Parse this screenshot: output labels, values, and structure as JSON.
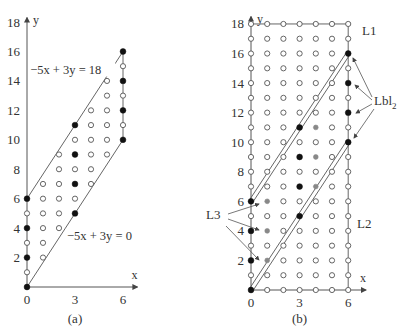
{
  "panels": [
    {
      "id": "a",
      "caption": "(a)",
      "origin_px": [
        27,
        287
      ],
      "unit_px": [
        16,
        14.72
      ],
      "axis_x_end": 6.9,
      "axis_y_end": 18.3,
      "x_axis_label": "x",
      "y_axis_label": "y",
      "x_ticks": [
        0,
        3,
        6
      ],
      "y_ticks": [
        2,
        4,
        6,
        8,
        10,
        12,
        14,
        16,
        18
      ],
      "lines": [
        {
          "name": "upper-constraint",
          "from": [
            0,
            6
          ],
          "to": [
            6,
            16
          ],
          "label": "−5x + 3y = 18",
          "label_pos": [
            0.2,
            14.5
          ]
        },
        {
          "name": "lower-constraint",
          "from": [
            0,
            0
          ],
          "to": [
            6,
            10
          ],
          "label": "−5x + 3y = 0",
          "label_pos": [
            2.5,
            3.2
          ]
        },
        {
          "name": "right-edge",
          "from": [
            6,
            10
          ],
          "to": [
            6,
            16
          ],
          "label": "",
          "label_pos": null
        }
      ],
      "filled_points": [
        [
          0,
          0
        ],
        [
          0,
          2
        ],
        [
          0,
          4
        ],
        [
          0,
          6
        ],
        [
          3,
          5
        ],
        [
          3,
          7
        ],
        [
          3,
          9
        ],
        [
          3,
          11
        ],
        [
          6,
          10
        ],
        [
          6,
          12
        ],
        [
          6,
          14
        ],
        [
          6,
          16
        ]
      ],
      "gray_points": [],
      "open_points": [
        [
          0,
          1
        ],
        [
          0,
          3
        ],
        [
          0,
          5
        ],
        [
          1,
          2
        ],
        [
          1,
          3
        ],
        [
          1,
          4
        ],
        [
          1,
          5
        ],
        [
          1,
          6
        ],
        [
          1,
          7
        ],
        [
          2,
          4
        ],
        [
          2,
          5
        ],
        [
          2,
          6
        ],
        [
          2,
          7
        ],
        [
          2,
          8
        ],
        [
          2,
          9
        ],
        [
          3,
          6
        ],
        [
          3,
          8
        ],
        [
          3,
          10
        ],
        [
          4,
          7
        ],
        [
          4,
          8
        ],
        [
          4,
          9
        ],
        [
          4,
          10
        ],
        [
          4,
          11
        ],
        [
          4,
          12
        ],
        [
          5,
          9
        ],
        [
          5,
          10
        ],
        [
          5,
          11
        ],
        [
          5,
          12
        ],
        [
          5,
          13
        ],
        [
          5,
          14
        ],
        [
          6,
          11
        ],
        [
          6,
          13
        ],
        [
          6,
          15
        ]
      ]
    },
    {
      "id": "b",
      "caption": "(b)",
      "origin_px": [
        251,
        290
      ],
      "unit_px": [
        16.2,
        14.78
      ],
      "axis_x_end": 7.1,
      "axis_y_end": 18.5,
      "x_axis_label": "x",
      "y_axis_label": "y",
      "x_ticks": [
        0,
        3,
        6
      ],
      "y_ticks": [
        2,
        4,
        6,
        8,
        10,
        12,
        14,
        16,
        18
      ],
      "grid_range": {
        "x": [
          0,
          6
        ],
        "y": [
          0,
          18
        ]
      },
      "border_lines": [
        {
          "name": "top-border",
          "from": [
            0,
            18
          ],
          "to": [
            6,
            18
          ]
        },
        {
          "name": "right-border",
          "from": [
            6,
            0
          ],
          "to": [
            6,
            18
          ]
        }
      ],
      "double_lines": [
        {
          "name": "L-upper-double",
          "from": [
            0,
            6
          ],
          "to": [
            6,
            16
          ]
        },
        {
          "name": "L-lower-double",
          "from": [
            0,
            0
          ],
          "to": [
            6,
            10
          ]
        }
      ],
      "filled_points": [
        [
          0,
          0
        ],
        [
          0,
          2
        ],
        [
          0,
          4
        ],
        [
          0,
          6
        ],
        [
          3,
          5
        ],
        [
          3,
          7
        ],
        [
          3,
          9
        ],
        [
          3,
          11
        ],
        [
          6,
          10
        ],
        [
          6,
          12
        ],
        [
          6,
          14
        ],
        [
          6,
          16
        ]
      ],
      "gray_points": [
        [
          1,
          2
        ],
        [
          1,
          4
        ],
        [
          1,
          6
        ],
        [
          4,
          7
        ],
        [
          4,
          9
        ],
        [
          4,
          11
        ]
      ],
      "labels": [
        {
          "name": "label-L1",
          "text": "L1",
          "pos_px": [
            362,
            35
          ]
        },
        {
          "name": "label-L2",
          "text": "L2",
          "pos_px": [
            357,
            228
          ]
        },
        {
          "name": "label-L3",
          "text": "L3",
          "pos_px": [
            206,
            219
          ]
        },
        {
          "name": "label-Lbl2",
          "text": "Lbl",
          "sub": "2",
          "pos_px": [
            374,
            105
          ]
        }
      ],
      "arrows": [
        {
          "name": "L3-arrow-1",
          "from_px": [
            228,
            214
          ],
          "to_px": [
            259,
            204
          ]
        },
        {
          "name": "L3-arrow-2",
          "from_px": [
            228,
            219
          ],
          "to_px": [
            259,
            230
          ]
        },
        {
          "name": "L3-arrow-3",
          "from_px": [
            226,
            226
          ],
          "to_px": [
            259,
            260
          ]
        },
        {
          "name": "Lbl2-arrow-1",
          "from_px": [
            372,
            97
          ],
          "to_px": [
            353,
            58
          ]
        },
        {
          "name": "Lbl2-arrow-2",
          "from_px": [
            372,
            100
          ],
          "to_px": [
            355,
            85
          ]
        },
        {
          "name": "Lbl2-arrow-3",
          "from_px": [
            372,
            104
          ],
          "to_px": [
            356,
            113
          ]
        },
        {
          "name": "Lbl2-arrow-4",
          "from_px": [
            374,
            109
          ],
          "to_px": [
            354,
            138
          ]
        }
      ]
    }
  ]
}
